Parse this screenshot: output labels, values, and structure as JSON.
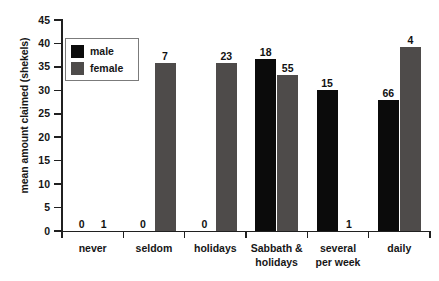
{
  "chart_data": {
    "type": "bar",
    "title": "",
    "xlabel": "",
    "ylabel": "mean amount claimed (shekels)",
    "ylim": [
      0,
      45
    ],
    "ytick_step": 5,
    "yticks": [
      0,
      5,
      10,
      15,
      20,
      25,
      30,
      35,
      40,
      45
    ],
    "grid": false,
    "legend_position": "upper-left-inside",
    "categories": [
      "never",
      "seldom",
      "holidays",
      "Sabbath &\nholidays",
      "several\nper week",
      "daily"
    ],
    "series": [
      {
        "name": "male",
        "color": "#0b0b0b",
        "values": [
          0,
          0,
          0,
          36.7,
          30.0,
          28.0
        ],
        "counts": [
          0,
          0,
          0,
          18,
          15,
          66
        ]
      },
      {
        "name": "female",
        "color": "#4e4b4a",
        "values": [
          0,
          35.8,
          35.8,
          33.3,
          0,
          39.2
        ],
        "counts": [
          1,
          7,
          23,
          55,
          1,
          4
        ]
      }
    ],
    "annotations": "Numbers above each bar are sample sizes (n)."
  },
  "legend": {
    "items": [
      {
        "label": "male",
        "color": "#0b0b0b"
      },
      {
        "label": "female",
        "color": "#4e4b4a"
      }
    ]
  },
  "axis": {
    "y_title": "mean amount claimed (shekels)",
    "y_labels": [
      "45",
      "40",
      "35",
      "30",
      "25",
      "20",
      "15",
      "10",
      "5",
      "0"
    ]
  },
  "x_labels": [
    "never",
    "seldom",
    "holidays",
    "Sabbath &\nholidays",
    "several\nper week",
    "daily"
  ],
  "bar_labels": {
    "male": [
      "0",
      "0",
      "0",
      "18",
      "15",
      "66"
    ],
    "female": [
      "1",
      "7",
      "23",
      "55",
      "1",
      "4"
    ]
  }
}
